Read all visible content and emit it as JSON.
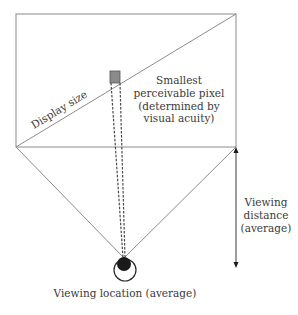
{
  "diagram": {
    "labels": {
      "display_size": "Display size",
      "pixel_line1": "Smallest",
      "pixel_line2": "perceivable pixel",
      "pixel_line3": "(determined by",
      "pixel_line4": "visual acuity)",
      "distance_line1": "Viewing",
      "distance_line2": "distance",
      "distance_line3": "(average)",
      "location": "Viewing location (average)"
    },
    "colors": {
      "line": "#8c8c8c",
      "pixel_fill": "#8a8a8a",
      "eye_pupil": "#1a1a1a",
      "text": "#3a3a3a"
    }
  }
}
